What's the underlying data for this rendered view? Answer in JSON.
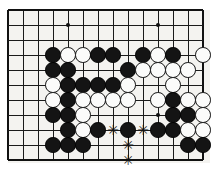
{
  "figure": {
    "kind": "go-board-diagram",
    "board": {
      "origin_x": 8,
      "origin_y": 10,
      "spacing": 15,
      "columns": 14,
      "rows": 11,
      "line_color": "#1a1a1a",
      "border_color": "#111111",
      "surface_color": "#f4f3f0",
      "line_width": 1,
      "border_width": 2
    },
    "colors": {
      "black_stone": "#141414",
      "white_stone": "#fbfbfa",
      "white_stone_edge": "#111111",
      "mark": "#121212",
      "background": "#ffffff"
    }
  },
  "hoshi": [
    {
      "col": 4,
      "row": 1
    },
    {
      "col": 10,
      "row": 1
    },
    {
      "col": 10,
      "row": 7
    }
  ],
  "stones": [
    {
      "col": 3,
      "row": 3,
      "color": "black"
    },
    {
      "col": 4,
      "row": 3,
      "color": "white"
    },
    {
      "col": 5,
      "row": 3,
      "color": "white"
    },
    {
      "col": 6,
      "row": 3,
      "color": "black"
    },
    {
      "col": 7,
      "row": 3,
      "color": "black"
    },
    {
      "col": 9,
      "row": 3,
      "color": "black"
    },
    {
      "col": 10,
      "row": 3,
      "color": "white"
    },
    {
      "col": 11,
      "row": 3,
      "color": "black"
    },
    {
      "col": 13,
      "row": 3,
      "color": "white"
    },
    {
      "col": 3,
      "row": 4,
      "color": "black"
    },
    {
      "col": 4,
      "row": 4,
      "color": "black"
    },
    {
      "col": 8,
      "row": 4,
      "color": "black"
    },
    {
      "col": 9,
      "row": 4,
      "color": "white"
    },
    {
      "col": 10,
      "row": 4,
      "color": "white"
    },
    {
      "col": 11,
      "row": 4,
      "color": "white"
    },
    {
      "col": 12,
      "row": 4,
      "color": "white"
    },
    {
      "col": 3,
      "row": 5,
      "color": "white"
    },
    {
      "col": 4,
      "row": 5,
      "color": "black"
    },
    {
      "col": 5,
      "row": 5,
      "color": "black"
    },
    {
      "col": 6,
      "row": 5,
      "color": "black"
    },
    {
      "col": 7,
      "row": 5,
      "color": "black"
    },
    {
      "col": 8,
      "row": 5,
      "color": "white"
    },
    {
      "col": 11,
      "row": 5,
      "color": "white"
    },
    {
      "col": 3,
      "row": 6,
      "color": "white"
    },
    {
      "col": 4,
      "row": 6,
      "color": "black"
    },
    {
      "col": 5,
      "row": 6,
      "color": "white"
    },
    {
      "col": 6,
      "row": 6,
      "color": "white"
    },
    {
      "col": 7,
      "row": 6,
      "color": "white"
    },
    {
      "col": 8,
      "row": 6,
      "color": "white"
    },
    {
      "col": 10,
      "row": 6,
      "color": "white"
    },
    {
      "col": 11,
      "row": 6,
      "color": "black"
    },
    {
      "col": 12,
      "row": 6,
      "color": "white"
    },
    {
      "col": 13,
      "row": 6,
      "color": "white"
    },
    {
      "col": 3,
      "row": 7,
      "color": "black"
    },
    {
      "col": 4,
      "row": 7,
      "color": "black"
    },
    {
      "col": 5,
      "row": 7,
      "color": "white"
    },
    {
      "col": 11,
      "row": 7,
      "color": "black"
    },
    {
      "col": 12,
      "row": 7,
      "color": "black"
    },
    {
      "col": 13,
      "row": 7,
      "color": "white"
    },
    {
      "col": 4,
      "row": 8,
      "color": "black"
    },
    {
      "col": 5,
      "row": 8,
      "color": "white"
    },
    {
      "col": 6,
      "row": 8,
      "color": "black"
    },
    {
      "col": 8,
      "row": 8,
      "color": "black"
    },
    {
      "col": 10,
      "row": 8,
      "color": "black"
    },
    {
      "col": 11,
      "row": 8,
      "color": "black"
    },
    {
      "col": 12,
      "row": 8,
      "color": "white"
    },
    {
      "col": 13,
      "row": 8,
      "color": "white"
    },
    {
      "col": 3,
      "row": 9,
      "color": "black"
    },
    {
      "col": 4,
      "row": 9,
      "color": "black"
    },
    {
      "col": 5,
      "row": 9,
      "color": "black"
    },
    {
      "col": 12,
      "row": 9,
      "color": "black"
    },
    {
      "col": 13,
      "row": 9,
      "color": "black"
    }
  ],
  "marks": [
    {
      "col": 7,
      "row": 8,
      "symbol": "✳",
      "label": "star-mark"
    },
    {
      "col": 9,
      "row": 8,
      "symbol": "✳",
      "label": "star-mark"
    },
    {
      "col": 8,
      "row": 9,
      "symbol": "✳",
      "label": "star-mark"
    },
    {
      "col": 8,
      "row": 10,
      "symbol": "✳",
      "label": "star-mark"
    }
  ]
}
